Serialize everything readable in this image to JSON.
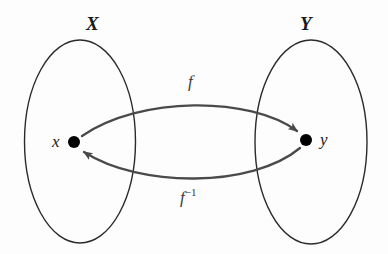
{
  "figure": {
    "name": "bijection-diagram",
    "background_color": "#fdfdfd",
    "stroke_color": "#4a4a4a",
    "ellipse_color": "#2b2b2b",
    "point_color": "#000000",
    "width": 388,
    "height": 254
  },
  "sets": [
    {
      "id": "X",
      "label": "X",
      "element_label": "x",
      "ellipse": {
        "cx": 80,
        "cy": 141.5,
        "rx": 55.5,
        "ry": 101.5
      },
      "point": {
        "cx": 74,
        "cy": 142,
        "r": 6
      }
    },
    {
      "id": "Y",
      "label": "Y",
      "element_label": "y",
      "ellipse": {
        "cx": 311,
        "cy": 142,
        "rx": 56,
        "ry": 102
      },
      "point": {
        "cx": 306,
        "cy": 140,
        "r": 6
      }
    }
  ],
  "arrows": [
    {
      "id": "forward",
      "label": "f",
      "superscript": "",
      "from": "x",
      "to": "y",
      "direction": "left-to-right",
      "curvature": "bows-upward"
    },
    {
      "id": "inverse",
      "label": "f",
      "superscript": "−1",
      "from": "y",
      "to": "x",
      "direction": "right-to-left",
      "curvature": "bows-downward"
    }
  ]
}
